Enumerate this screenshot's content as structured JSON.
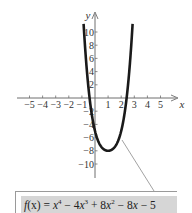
{
  "chart_data": {
    "type": "line",
    "title": "",
    "xlabel": "x",
    "ylabel": "y",
    "xlim": [
      -5.5,
      6.2
    ],
    "ylim": [
      -12,
      13
    ],
    "grid": false,
    "x_ticks": [
      -5,
      -4,
      -3,
      -2,
      -1,
      1,
      2,
      3,
      4,
      5
    ],
    "x_tick_labels": [
      "−5",
      "−4",
      "−3",
      "−2",
      "−1",
      "1",
      "2",
      "3",
      "4",
      "5"
    ],
    "y_ticks": [
      10,
      8,
      6,
      4,
      2,
      -2,
      -4,
      -6,
      -8,
      -10
    ],
    "y_tick_labels": [
      "10",
      "8",
      "6",
      "4",
      "2",
      "−2",
      "−4",
      "−6",
      "−8",
      "−10"
    ],
    "series": [
      {
        "name": "f(x) = x^4 − 4x^3 + 8x^2 − 8x − 5",
        "expression": "x^4 - 4x^3 + 8x^2 - 8x - 5",
        "x": [
          -0.87,
          -0.75,
          -0.5,
          -0.25,
          0,
          0.25,
          0.5,
          0.75,
          1,
          1.25,
          1.5,
          1.75,
          2,
          2.25,
          2.5,
          2.75,
          2.87
        ],
        "y": [
          12.0,
          7.5,
          1.06,
          -2.73,
          -5,
          -6.39,
          -7.19,
          -7.68,
          -8,
          -8.31,
          -8.69,
          -9.13,
          -9,
          -7.55,
          -3.94,
          4.28,
          11.1
        ]
      }
    ],
    "annotations": [
      {
        "text": "f(x) = x⁴ − 4x³ + 8x² − 8x − 5",
        "position": "bottom box with leader line to curve"
      }
    ],
    "minimum": {
      "x": 1,
      "y": -8
    }
  },
  "formula": {
    "fx": "f",
    "arg": "(x)",
    "eq": " = ",
    "t1": "x",
    "e1": "4",
    "op1": " − 4",
    "t2": "x",
    "e2": "3",
    "op2": " + 8",
    "t3": "x",
    "e3": "2",
    "op3": " − 8",
    "t4": "x",
    "op4": " − 5"
  },
  "axes": {
    "x_label": "x",
    "y_label": "y"
  }
}
